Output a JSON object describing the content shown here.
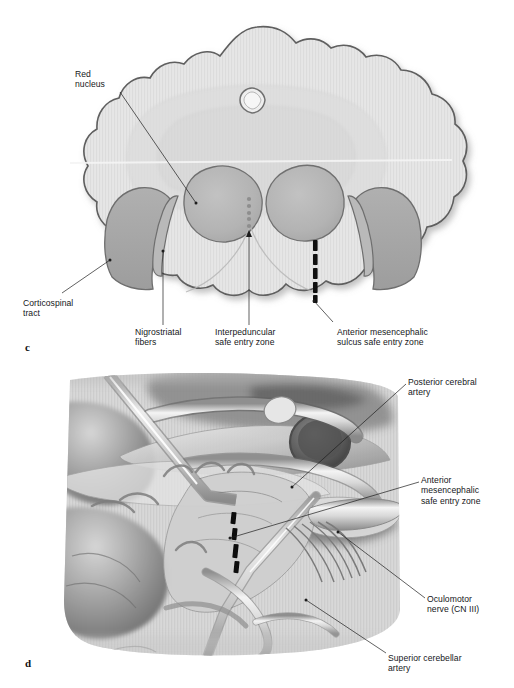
{
  "figure": {
    "type": "medical-illustration",
    "background_color": "#ffffff",
    "panels": [
      {
        "letter": "c",
        "name": "midbrain-axial-cross-section",
        "description": "Axial cross-section of the midbrain showing safe entry zones",
        "labels": [
          {
            "id": "red-nucleus",
            "text": "Red\nnucleus"
          },
          {
            "id": "corticospinal-tract",
            "text": "Corticospinal\ntract"
          },
          {
            "id": "nigrostriatal-fibers",
            "text": "Nigrostriatal\nfibers"
          },
          {
            "id": "interpeduncular-sez",
            "text": "Interpeduncular\nsafe entry zone"
          },
          {
            "id": "anterior-mesencephalic-sulcus-sez",
            "text": "Anterior mesencephalic\nsulcus safe entry zone"
          }
        ]
      },
      {
        "letter": "d",
        "name": "surgical-corridor-view",
        "description": "Operative view of the anterior mesencephalic region",
        "labels": [
          {
            "id": "posterior-cerebral-artery",
            "text": "Posterior cerebral\nartery"
          },
          {
            "id": "anterior-mesencephalic-sez",
            "text": "Anterior\nmesencephalic\nsafe entry zone"
          },
          {
            "id": "oculomotor-nerve",
            "text": "Oculomotor\nnerve (CN III)"
          },
          {
            "id": "superior-cerebellar-artery",
            "text": "Superior cerebellar\nartery"
          }
        ]
      }
    ],
    "colors": {
      "outline": "#5a5a5a",
      "parenchyma_light": "#e3e3e3",
      "parenchyma_mid": "#d2d2d2",
      "nucleus_grey": "#b4b4b4",
      "peduncle_grey": "#a9a9a9",
      "entry_zone_marker": "#111111",
      "leader_line": "#1d1d1d"
    }
  }
}
